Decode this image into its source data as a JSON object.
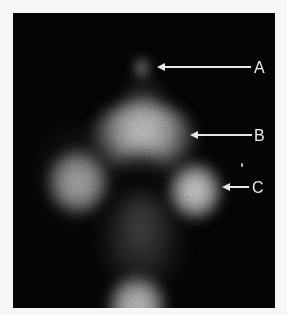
{
  "image": {
    "type": "scintigraphy scan",
    "background_color": "#050505",
    "page_color": "#f7f7f7"
  },
  "annotations": [
    {
      "id": "A",
      "label": "A",
      "target": "small upper uptake focus"
    },
    {
      "id": "B",
      "label": "B",
      "target": "central arc uptake region"
    },
    {
      "id": "C",
      "label": "C",
      "target": "right lateral uptake focus"
    }
  ],
  "colors": {
    "arrow": "#e6e6e6",
    "label": "#ececec",
    "uptake_bright": "#d8d8d8",
    "uptake_dim": "#6a6a6a"
  }
}
